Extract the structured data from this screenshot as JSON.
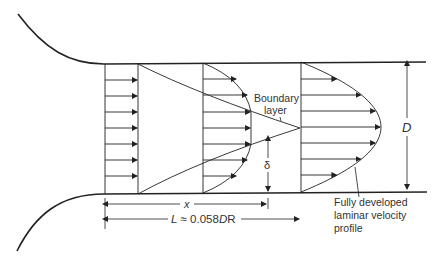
{
  "diagram": {
    "labels": {
      "boundary_layer_line1": "Boundary",
      "boundary_layer_line2": "layer",
      "delta": "δ",
      "diameter": "D",
      "x": "x",
      "length": "L ≈ 0.058DR",
      "length_prefix": "L",
      "length_eq": " ≈ 0.058",
      "length_D": "D",
      "length_R": "R",
      "fully_developed_line1": "Fully developed",
      "fully_developed_line2": "laminar velocity",
      "fully_developed_line3": "profile"
    },
    "profiles": [
      {
        "name": "uniform-inlet-profile",
        "shape": "uniform"
      },
      {
        "name": "developing-profile",
        "shape": "flat-core-with-boundary-layer"
      },
      {
        "name": "fully-developed-profile",
        "shape": "parabolic"
      }
    ],
    "colors": {
      "line": "#222222",
      "text": "#333333"
    }
  }
}
